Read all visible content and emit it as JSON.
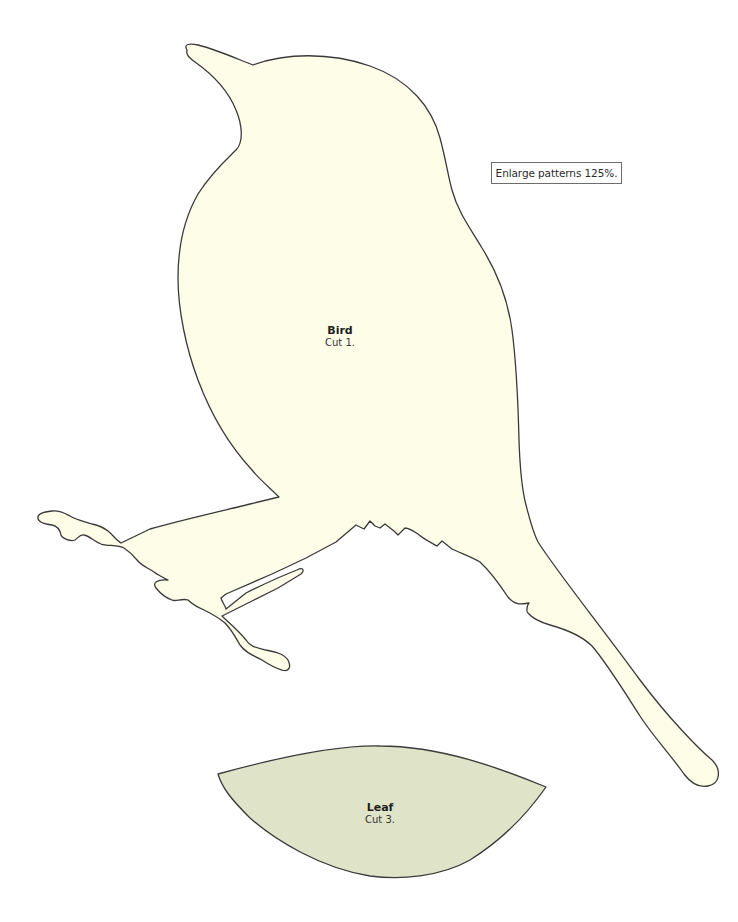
{
  "note": {
    "text": "Enlarge patterns 125%."
  },
  "pieces": [
    {
      "name": "Bird",
      "instruction": "Cut 1.",
      "fill_color": "#fdfde8",
      "outline_color": "#3a3a3a"
    },
    {
      "name": "Leaf",
      "instruction": "Cut 3.",
      "fill_color": "#dfe3c7",
      "outline_color": "#3a3a3a"
    }
  ],
  "colors": {
    "page_background": "#ffffff",
    "note_border": "#6d6d6d"
  }
}
